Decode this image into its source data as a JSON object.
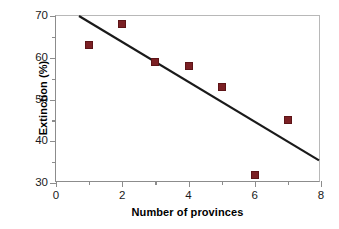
{
  "chart_data": {
    "type": "scatter",
    "title": "",
    "xlabel": "Number of provinces",
    "ylabel": "Extinction (%)",
    "xlim": [
      0,
      8
    ],
    "ylim": [
      30,
      70
    ],
    "grid": false,
    "legend": null,
    "x": [
      1,
      2,
      3,
      4,
      5,
      6,
      7
    ],
    "values": [
      63,
      68,
      59,
      58,
      53,
      32,
      45
    ],
    "series": [
      {
        "name": "Extinction",
        "marker": "square",
        "color": "#7b2024",
        "points": [
          {
            "x": 1,
            "y": 63
          },
          {
            "x": 2,
            "y": 68
          },
          {
            "x": 3,
            "y": 59
          },
          {
            "x": 4,
            "y": 58
          },
          {
            "x": 5,
            "y": 53
          },
          {
            "x": 6,
            "y": 32
          },
          {
            "x": 7,
            "y": 45
          }
        ]
      },
      {
        "name": "Trend line",
        "type": "line",
        "color": "#1a1a1a",
        "endpoints": [
          {
            "x": 0.7,
            "y": 70
          },
          {
            "x": 8,
            "y": 35
          }
        ]
      }
    ],
    "xticks": [
      0,
      2,
      4,
      6,
      8
    ],
    "xticks_minor": [
      1,
      3,
      5,
      7
    ],
    "yticks": [
      30,
      40,
      50,
      60,
      70
    ],
    "yticks_minor": [
      35,
      45,
      55,
      65
    ],
    "xtick_labels": [
      "0",
      "2",
      "4",
      "6",
      "8"
    ],
    "ytick_labels": [
      "30",
      "40",
      "50",
      "60",
      "70"
    ]
  },
  "colors": {
    "marker": "#7b2024",
    "marker_edge": "#5d1417",
    "line": "#1a1a1a",
    "axis": "#8c8c8c",
    "frame": "#b8b8b8",
    "text": "#000000",
    "background": "#ffffff"
  }
}
